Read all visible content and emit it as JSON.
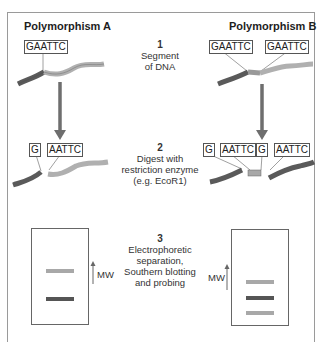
{
  "columns": {
    "left_title": "Polymorphism A",
    "right_title": "Polymorphism B"
  },
  "sequences": {
    "a_site": "GAATTC",
    "b_site1": "GAATTC",
    "b_site2": "GAATTC",
    "a_cut_left": "G",
    "a_cut_right": "AATTC",
    "b_cut_1": "G",
    "b_cut_2": "AATTC",
    "b_cut_3": "G",
    "b_cut_4": "AATTC"
  },
  "steps": [
    {
      "num": "1",
      "line1": "Segment",
      "line2": "of DNA",
      "line3": ""
    },
    {
      "num": "2",
      "line1": "Digest with",
      "line2": "restriction enzyme",
      "line3": "(e.g. EcoR1)"
    },
    {
      "num": "3",
      "line1": "Electrophoretic",
      "line2": "separation,",
      "line3": "Southern blotting",
      "line4": "and probing"
    }
  ],
  "gels": {
    "mw_label_left": "MW",
    "mw_label_right": "MW",
    "left_bands": [
      {
        "shade": "light",
        "color": "#a8a8a8"
      },
      {
        "shade": "dark",
        "color": "#555555"
      }
    ],
    "right_bands": [
      {
        "shade": "light",
        "color": "#a8a8a8"
      },
      {
        "shade": "dark",
        "color": "#555555"
      },
      {
        "shade": "light",
        "color": "#a8a8a8"
      }
    ]
  },
  "colors": {
    "dna_dark": "#5a5a5a",
    "dna_light": "#b0b0b0",
    "arrow": "#6e6e6e",
    "frame": "#9a9a9a"
  }
}
